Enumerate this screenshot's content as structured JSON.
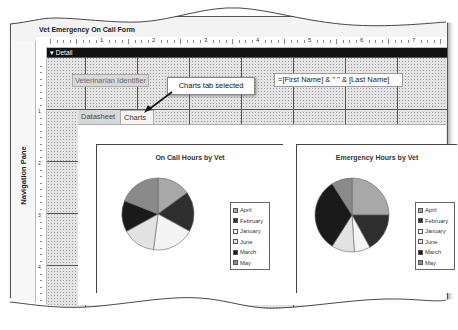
{
  "window": {
    "form_tab_title": "Vet Emergency On Call Form",
    "section_bar_label": "Detail",
    "navigation_pane_label": "Navigation Pane"
  },
  "ruler": {
    "horizontal_numbers": [
      "1",
      "2",
      "3",
      "4",
      "5",
      "6",
      "7"
    ],
    "vertical_numbers": [
      "1",
      "2",
      "3",
      "4"
    ]
  },
  "form": {
    "label_text": "Veterinarian Identifier",
    "expression_value": "=[First Name] & \" \" & [Last Name]"
  },
  "callout": {
    "text": "Charts tab selected"
  },
  "tabs": [
    {
      "label": "Datasheet",
      "selected": false
    },
    {
      "label": "Charts",
      "selected": true
    }
  ],
  "colors": {
    "april": "#a8a8a8",
    "february": "#2e2e2e",
    "january": "#f4f4f4",
    "june": "#e2e2e2",
    "march": "#1a1a1a",
    "may": "#8a8a8a",
    "section_bar": "#111111"
  },
  "chart_data": [
    {
      "type": "pie",
      "title": "On Call Hours by Vet",
      "categories": [
        "April",
        "February",
        "January",
        "June",
        "March",
        "May"
      ],
      "values": [
        15,
        18,
        19,
        15,
        14,
        19
      ],
      "legend_position": "right"
    },
    {
      "type": "pie",
      "title": "Emergency Hours by Vet",
      "categories": [
        "April",
        "February",
        "January",
        "June",
        "March",
        "May"
      ],
      "values": [
        25,
        17,
        7,
        10,
        32,
        9
      ],
      "legend_position": "right"
    }
  ]
}
